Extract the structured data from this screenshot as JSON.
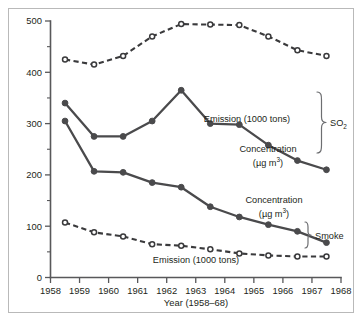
{
  "chart_data": {
    "type": "line",
    "title": "",
    "xlabel": "Year (1958–68)",
    "ylabel": "",
    "xlim": [
      1958,
      1968
    ],
    "ylim": [
      0,
      500
    ],
    "grid": false,
    "legend_position": "inline-annotations",
    "x_ticklabels": [
      "1958",
      "1959",
      "1960",
      "1961",
      "1962",
      "1963",
      "1964",
      "1965",
      "1966",
      "1967",
      "1968"
    ],
    "y_ticklabels": [
      "0",
      "100",
      "200",
      "300",
      "400",
      "500"
    ],
    "y_minor_ticks": [
      50,
      150,
      250,
      350,
      450
    ],
    "x": [
      1958.5,
      1959.5,
      1960.5,
      1961.5,
      1962.5,
      1963.5,
      1964.5,
      1965.5,
      1966.5,
      1967.5
    ],
    "series": [
      {
        "name": "SO2 Emission (1000 tons)",
        "marker": "open-circle",
        "line": "dashed",
        "values": [
          425,
          415,
          432,
          470,
          494,
          493,
          492,
          470,
          443,
          432
        ]
      },
      {
        "name": "SO2 Concentration (µg m³)",
        "marker": "filled-circle",
        "line": "solid",
        "values": [
          340,
          275,
          275,
          305,
          365,
          300,
          298,
          258,
          228,
          210
        ]
      },
      {
        "name": "Smoke Concentration (µg m³)",
        "marker": "filled-circle",
        "line": "solid",
        "values": [
          305,
          207,
          205,
          185,
          176,
          138,
          118,
          103,
          90,
          68
        ]
      },
      {
        "name": "Smoke Emission (1000 tons)",
        "marker": "open-circle",
        "line": "dashed",
        "values": [
          107,
          88,
          80,
          65,
          62,
          55,
          47,
          43,
          41,
          41
        ]
      }
    ],
    "annotations": [
      {
        "id": "so2-emission-label",
        "text": "Emission (1000 tons)"
      },
      {
        "id": "so2-concentration-label",
        "text": "Concentration"
      },
      {
        "id": "so2-concentration-units",
        "text": "(µg m",
        "sup": "3",
        "tail": ")"
      },
      {
        "id": "smoke-concentration-label",
        "text": "Concentration"
      },
      {
        "id": "smoke-concentration-units",
        "text": "(µg m",
        "sup": "3",
        "tail": ")"
      },
      {
        "id": "smoke-emission-label",
        "text": "Emission (1000 tons)"
      },
      {
        "id": "group-so2",
        "text": "SO",
        "sub": "2"
      },
      {
        "id": "group-smoke",
        "text": "Smoke"
      }
    ]
  },
  "axis": {
    "x_title": "Year (1958–68)",
    "y_labels": [
      "500",
      "400",
      "300",
      "200",
      "100",
      "0"
    ],
    "x_labels": [
      "1958",
      "1959",
      "1960",
      "1961",
      "1962",
      "1963",
      "1964",
      "1965",
      "1966",
      "1967",
      "1968"
    ]
  },
  "labels": {
    "so2_emission": "Emission (1000 tons)",
    "so2_concentration": "Concentration",
    "so2_units_head": "(µg m",
    "so2_units_sup": "3",
    "so2_units_tail": ")",
    "smoke_concentration": "Concentration",
    "smoke_units_head": "(µg m",
    "smoke_units_sup": "3",
    "smoke_units_tail": ")",
    "smoke_emission": "Emission (1000 tons)",
    "group_so2_head": "SO",
    "group_so2_sub": "2",
    "group_smoke": "Smoke"
  },
  "colors": {
    "frame": "#b9b9b9",
    "axis": "#58585a",
    "solid_line": "#4a4a4c",
    "dashed_line": "#3a3a3c",
    "text": "#231f20",
    "background": "#ffffff"
  }
}
